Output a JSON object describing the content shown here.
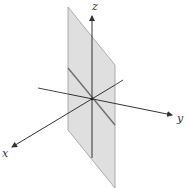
{
  "figure": {
    "colors": {
      "background": "#ffffff",
      "plane_fill": "#d9d9d9",
      "plane_edge": "#9a9a9a",
      "axis": "#333333",
      "trace_line": "#6e6e6e"
    },
    "axes": {
      "x": {
        "label": "x"
      },
      "y": {
        "label": "y"
      },
      "z": {
        "label": "z"
      }
    },
    "plane": {
      "name": "vertical plane through z-axis"
    }
  }
}
